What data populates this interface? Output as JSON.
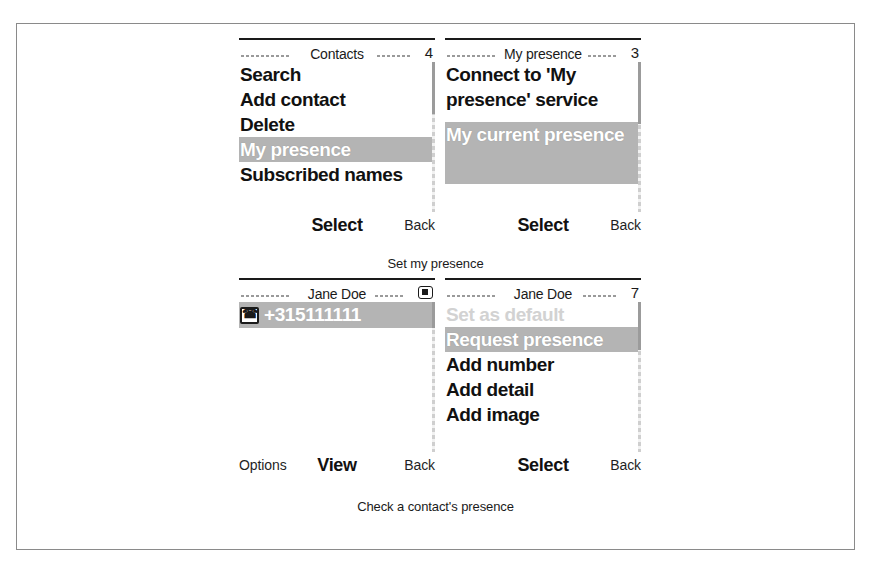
{
  "figure": {
    "captions": {
      "top": "Set my presence",
      "bottom": "Check a contact's presence"
    }
  },
  "colors": {
    "selection_bg": "#b4b4b4",
    "selection_fg": "#ffffff",
    "text": "#111111",
    "disabled_text": "#d2d2d2",
    "frame_border": "#8a8a8a"
  },
  "screens": [
    {
      "id": "contacts",
      "title": "Contacts",
      "count": "4",
      "indicator": "count",
      "items": [
        {
          "label": "Search",
          "state": "normal"
        },
        {
          "label": "Add contact",
          "state": "normal"
        },
        {
          "label": "Delete",
          "state": "normal"
        },
        {
          "label": "My presence",
          "state": "selected"
        },
        {
          "label": "Subscribed names",
          "state": "normal"
        }
      ],
      "softkeys": {
        "left": "",
        "middle": "Select",
        "right": "Back"
      }
    },
    {
      "id": "my-presence",
      "title": "My presence",
      "count": "3",
      "indicator": "count",
      "items": [
        {
          "label": "Connect to 'My presence' service",
          "state": "normal"
        },
        {
          "label": "My current presence",
          "state": "selected"
        }
      ],
      "softkeys": {
        "left": "",
        "middle": "Select",
        "right": "Back"
      }
    },
    {
      "id": "jane-doe-details",
      "title": "Jane Doe",
      "count": "",
      "indicator": "card-icon",
      "number": {
        "value": "+315111111",
        "type_icon": "phone-icon",
        "state": "selected"
      },
      "items": [],
      "softkeys": {
        "left": "Options",
        "middle": "View",
        "right": "Back"
      }
    },
    {
      "id": "jane-doe-options",
      "title": "Jane Doe",
      "count": "7",
      "indicator": "count",
      "items": [
        {
          "label": "Set as default",
          "state": "disabled"
        },
        {
          "label": "Request presence",
          "state": "selected"
        },
        {
          "label": "Add number",
          "state": "normal"
        },
        {
          "label": "Add detail",
          "state": "normal"
        },
        {
          "label": "Add image",
          "state": "normal"
        }
      ],
      "softkeys": {
        "left": "",
        "middle": "Select",
        "right": "Back"
      }
    }
  ]
}
